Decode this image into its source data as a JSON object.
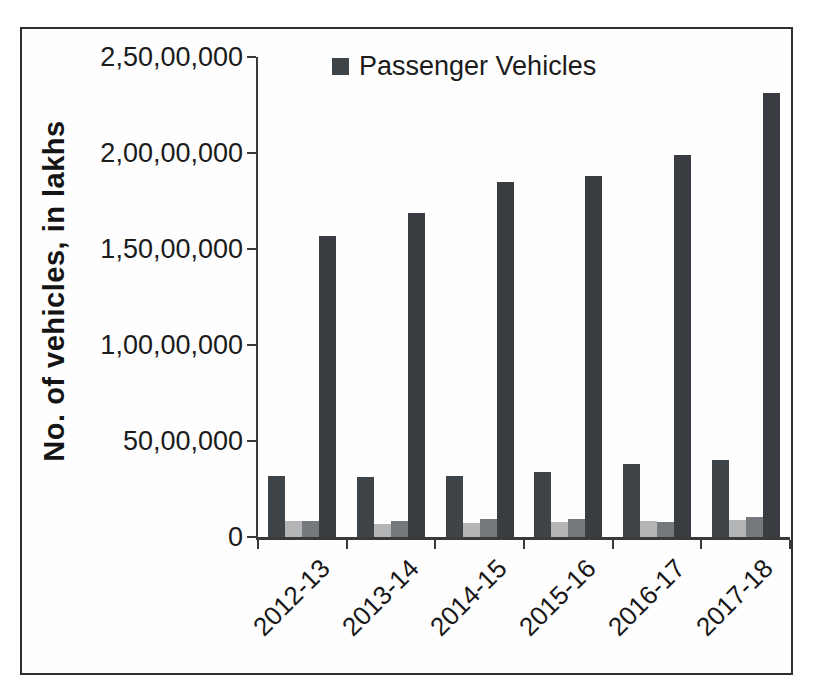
{
  "window": {
    "width": 815,
    "height": 690
  },
  "figure": {
    "border_color": "#2f2f2f",
    "background": "#ffffff",
    "axis_color": "#3a3a3a",
    "text_color": "#1b1b1b"
  },
  "legend": {
    "items": [
      {
        "label": "Passenger Vehicles",
        "color": "#3f4449"
      }
    ]
  },
  "y_axis": {
    "title": "No. of vehicles, in lakhs",
    "tick_labels": [
      "2,50,00,000",
      "2,00,00,000",
      "1,50,00,000",
      "1,00,00,000",
      "50,00,000",
      "0"
    ],
    "min": 0,
    "max": 25000000
  },
  "x_axis": {
    "categories": [
      "2012-13",
      "2013-14",
      "2014-15",
      "2015-16",
      "2016-17",
      "2017-18"
    ]
  },
  "chart_data": {
    "type": "bar",
    "title": "",
    "xlabel": "",
    "ylabel": "No. of vehicles, in lakhs",
    "ylim": [
      0,
      25000000
    ],
    "y_tick_interval": 5000000,
    "grid": false,
    "legend_position": "top-center",
    "legend_entries_visible": [
      "Passenger Vehicles"
    ],
    "categories": [
      "2012-13",
      "2013-14",
      "2014-15",
      "2015-16",
      "2016-17",
      "2017-18"
    ],
    "series": [
      {
        "name": "Passenger Vehicles",
        "color": "#3f4449",
        "values": [
          3200000,
          3100000,
          3200000,
          3400000,
          3800000,
          4000000
        ]
      },
      {
        "name": "unlabeled-series-light-gray",
        "color": "#b3b5b6",
        "values": [
          830000,
          700000,
          720000,
          790000,
          820000,
          900000
        ]
      },
      {
        "name": "unlabeled-series-medium-gray",
        "color": "#75797d",
        "values": [
          840000,
          830000,
          950000,
          930000,
          780000,
          1020000
        ]
      },
      {
        "name": "unlabeled-series-dark-tall",
        "color": "#393d41",
        "values": [
          15700000,
          16900000,
          18500000,
          18800000,
          19900000,
          23100000
        ]
      }
    ]
  }
}
